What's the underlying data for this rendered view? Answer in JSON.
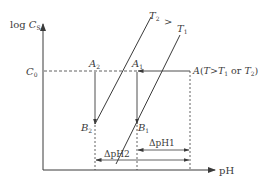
{
  "diagram": {
    "y_axis_label": "log",
    "y_axis_var": "C",
    "y_axis_sub": "S",
    "x_axis_label": "pH",
    "c0_label": "C",
    "c0_sub": "0",
    "point_A": "A",
    "point_A_note_open": "(",
    "point_A_T": "T",
    "point_A_gt": ">",
    "point_A_T1": "T",
    "point_A_T1_sub": "1",
    "point_A_or": " or ",
    "point_A_T2": "T",
    "point_A_T2_sub": "2",
    "point_A_note_close": ")",
    "point_A1": "A",
    "point_A1_sub": "1",
    "point_A2": "A",
    "point_A2_sub": "2",
    "point_B1": "B",
    "point_B1_sub": "1",
    "point_B2": "B",
    "point_B2_sub": "2",
    "curve_T2": "T",
    "curve_T2_sub": "2",
    "curve_compare": ">",
    "curve_T1": "T",
    "curve_T1_sub": "1",
    "delta_pH1": "ΔpH1",
    "delta_pH2": "ΔpH2"
  },
  "colors": {
    "line": "#3a3a3a",
    "background": "#ffffff"
  }
}
